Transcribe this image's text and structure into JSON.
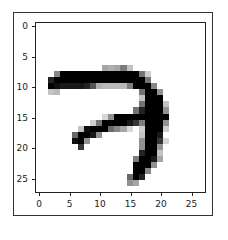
{
  "chart_data": {
    "type": "heatmap",
    "title": "",
    "xlabel": "",
    "ylabel": "",
    "colormap": "gray_r",
    "xlim": [
      -0.5,
      27.5
    ],
    "ylim": [
      27.5,
      -0.5
    ],
    "xticks": [
      0,
      5,
      10,
      15,
      20,
      25
    ],
    "yticks": [
      0,
      5,
      10,
      15,
      20,
      25
    ],
    "grid": false,
    "shape": [
      28,
      28
    ],
    "pixels": {
      "7": {
        "11": 90,
        "12": 80,
        "13": 90,
        "14": 130,
        "15": 60
      },
      "8": {
        "3": 120,
        "4": 255,
        "5": 255,
        "6": 255,
        "7": 255,
        "8": 255,
        "9": 255,
        "10": 255,
        "11": 255,
        "12": 255,
        "13": 255,
        "14": 255,
        "15": 255,
        "16": 255,
        "17": 140,
        "18": 50
      },
      "9": {
        "2": 220,
        "3": 255,
        "4": 255,
        "5": 255,
        "6": 255,
        "7": 255,
        "8": 255,
        "9": 255,
        "10": 255,
        "11": 255,
        "12": 255,
        "13": 255,
        "14": 255,
        "15": 255,
        "16": 255,
        "17": 255,
        "18": 140
      },
      "10": {
        "2": 255,
        "3": 240,
        "4": 230,
        "5": 230,
        "6": 230,
        "7": 230,
        "8": 220,
        "9": 170,
        "10": 80,
        "11": 70,
        "12": 70,
        "13": 70,
        "14": 70,
        "15": 130,
        "16": 255,
        "17": 255,
        "18": 255,
        "19": 120
      },
      "11": {
        "2": 60,
        "3": 70,
        "17": 140,
        "18": 255,
        "19": 255,
        "20": 110
      },
      "12": {
        "17": 60,
        "18": 255,
        "19": 255,
        "20": 255
      },
      "13": {
        "17": 140,
        "18": 255,
        "19": 255,
        "20": 255,
        "21": 60
      },
      "14": {
        "16": 140,
        "17": 220,
        "18": 255,
        "19": 255,
        "20": 255,
        "21": 110
      },
      "15": {
        "11": 40,
        "12": 110,
        "13": 255,
        "14": 255,
        "15": 255,
        "16": 255,
        "17": 255,
        "18": 255,
        "19": 255,
        "20": 255,
        "21": 255
      },
      "16": {
        "9": 50,
        "10": 140,
        "11": 255,
        "12": 255,
        "13": 255,
        "14": 255,
        "15": 230,
        "16": 200,
        "17": 130,
        "18": 255,
        "19": 255,
        "20": 255,
        "21": 110
      },
      "17": {
        "7": 60,
        "8": 240,
        "9": 255,
        "10": 255,
        "11": 255,
        "12": 150,
        "13": 120,
        "14": 90,
        "15": 40,
        "17": 50,
        "18": 255,
        "19": 255,
        "20": 255,
        "21": 50
      },
      "18": {
        "6": 150,
        "7": 255,
        "8": 255,
        "9": 230,
        "10": 110,
        "17": 60,
        "18": 255,
        "19": 255,
        "20": 230
      },
      "19": {
        "6": 240,
        "7": 255,
        "8": 110,
        "17": 110,
        "18": 255,
        "19": 255,
        "20": 200,
        "21": 40
      },
      "20": {
        "7": 200,
        "17": 110,
        "18": 255,
        "19": 255,
        "20": 110
      },
      "21": {
        "17": 220,
        "18": 255,
        "19": 255,
        "20": 60
      },
      "22": {
        "16": 130,
        "17": 255,
        "18": 255,
        "19": 230,
        "20": 90
      },
      "23": {
        "16": 255,
        "17": 255,
        "18": 255,
        "19": 110
      },
      "24": {
        "16": 255,
        "17": 255,
        "18": 120
      },
      "25": {
        "15": 150,
        "16": 255,
        "17": 220
      },
      "26": {
        "15": 110,
        "16": 90
      }
    }
  },
  "axes": {
    "xtick_labels": [
      "0",
      "5",
      "10",
      "15",
      "20",
      "25"
    ],
    "ytick_labels": [
      "0",
      "5",
      "10",
      "15",
      "20",
      "25"
    ]
  }
}
